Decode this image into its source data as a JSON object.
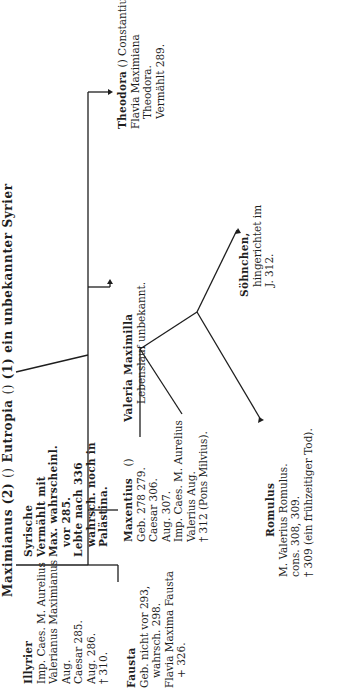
{
  "orientation": "rotated-90-counterclockwise",
  "header": {
    "maximianus": "Maximianus (2)",
    "marriage_symbol_1": "()",
    "eutropia": "Eutropia",
    "marriage_symbol_2": "()",
    "eutropia_note": "(1) ein unbekannter Syrier"
  },
  "maximianus_details": [
    "Illyrier",
    "Imp. Caes. M. Aurelius",
    "Valerianus Maximianus",
    "Aug.",
    "Caesar 285.",
    "Aug. 286.",
    "† 310."
  ],
  "eutropia_details": [
    "Syrische",
    "Vermählt mit",
    "Max. wahrscheinl.",
    "vor 285.",
    "Lebte nach 336",
    "wahrsch. noch in",
    "Palästina."
  ],
  "children": {
    "fausta": {
      "name": "Fausta",
      "lines": [
        "Geb. nicht vor 293,",
        "wahrsch. 298.",
        "Flavia Maxima Fausta",
        "+ 326."
      ]
    },
    "maxentius": {
      "name": "Maxentius",
      "marriage_symbol": "()",
      "spouse": "Valeria Maximilla",
      "lines": [
        "Geb. 278 279.",
        "Caesar 306.",
        "Aug. 307.",
        "Imp. Caes. M. Aurelius",
        "Valerius Aug.",
        "† 312 (Pons Milvius)."
      ],
      "spouse_lines": [
        "Lebenslauf unbekannt."
      ]
    },
    "theodora": {
      "name": "Theodora",
      "marriage_symbol": "()",
      "spouse": "Constantius I.",
      "lines": [
        "Flavia Maximiana",
        "Theodora.",
        "Vermählt 289."
      ]
    }
  },
  "grandchildren": {
    "romulus": {
      "name": "Romulus",
      "lines": [
        "M. Valerius Romulus.",
        "cons. 308, 309.",
        "† 309 (ein frühzeitiger Tod)."
      ]
    },
    "soehnchen": {
      "name": "Söhnchen,",
      "lines": [
        "hingerichtet im",
        "J. 312."
      ]
    }
  }
}
